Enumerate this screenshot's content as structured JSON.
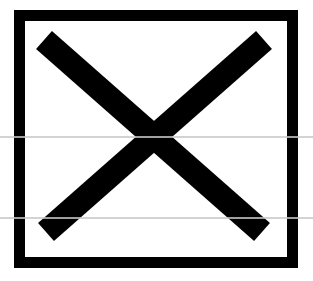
{
  "icon": {
    "name": "close-x-box",
    "symbol": "✕"
  },
  "colors": {
    "stroke": "#000000",
    "background": "#ffffff",
    "scanline": "#c8c8c8"
  }
}
